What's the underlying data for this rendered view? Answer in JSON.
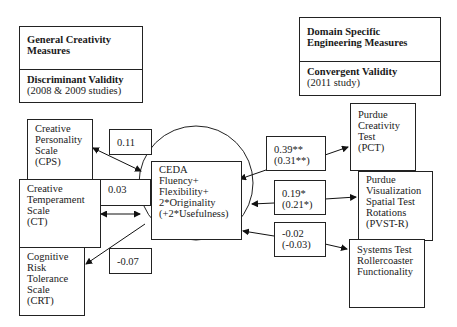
{
  "legend_left": {
    "title": "General Creativity\nMeasures",
    "validity": "Discriminant Validity",
    "note": "(2008 & 2009 studies)"
  },
  "legend_right": {
    "title": "Domain Specific\nEngineering Measures",
    "validity": "Convergent Validity",
    "note": "(2011 study)"
  },
  "center": {
    "text": "CEDA\nFluency+\nFlexibility+\n2*Originality\n(+2*Usefulness)"
  },
  "left_measures": [
    {
      "label": "Creative\nPersonality\nScale\n(CPS)",
      "correlation": "0.11"
    },
    {
      "label": "Creative\nTemperament\nScale\n(CT)",
      "correlation": "0.03"
    },
    {
      "label": "Cognitive\nRisk\nTolerance\nScale\n(CRT)",
      "correlation": "-0.07"
    }
  ],
  "right_measures": [
    {
      "label": "Purdue\nCreativity\nTest\n(PCT)",
      "correlation": "0.39**\n(0.31**)"
    },
    {
      "label": "Purdue\nVisualization\nSpatial Test\nRotations\n(PVST-R)",
      "correlation": "0.19*\n(0.21*)"
    },
    {
      "label": "Systems Test\nRollercoaster\nFunctionality",
      "correlation": "-0.02\n(-0.03)"
    }
  ]
}
